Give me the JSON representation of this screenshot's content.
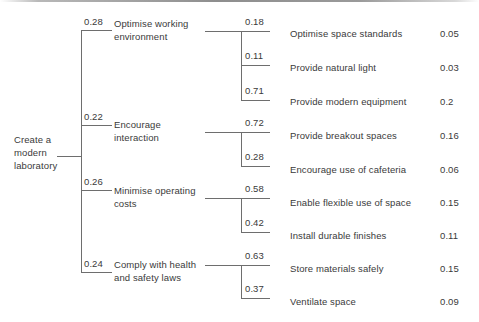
{
  "diagram": {
    "type": "weighted-hierarchy-tree",
    "root": {
      "label": "Create a\nmodern\nlaboratory"
    },
    "level1": [
      {
        "weight": "0.28",
        "label": "Optimise working\nenvironment"
      },
      {
        "weight": "0.22",
        "label": "Encourage\ninteraction"
      },
      {
        "weight": "0.26",
        "label": "Minimise operating\ncosts"
      },
      {
        "weight": "0.24",
        "label": "Comply with health\nand safety laws"
      }
    ],
    "level2": [
      {
        "weight": "0.18",
        "label": "Optimise space standards",
        "value": "0.05"
      },
      {
        "weight": "0.11",
        "label": "Provide natural light",
        "value": "0.03"
      },
      {
        "weight": "0.71",
        "label": "Provide modern equipment",
        "value": "0.2"
      },
      {
        "weight": "0.72",
        "label": "Provide breakout spaces",
        "value": "0.16"
      },
      {
        "weight": "0.28",
        "label": "Encourage use of cafeteria",
        "value": "0.06"
      },
      {
        "weight": "0.58",
        "label": "Enable flexible use of space",
        "value": "0.15"
      },
      {
        "weight": "0.42",
        "label": "Install durable finishes",
        "value": "0.11"
      },
      {
        "weight": "0.63",
        "label": "Store materials safely",
        "value": "0.15"
      },
      {
        "weight": "0.37",
        "label": "Ventilate space",
        "value": "0.09"
      }
    ],
    "colors": {
      "line": "#6e6e6e",
      "text": "#3a3a3a",
      "background": "#ffffff"
    }
  }
}
